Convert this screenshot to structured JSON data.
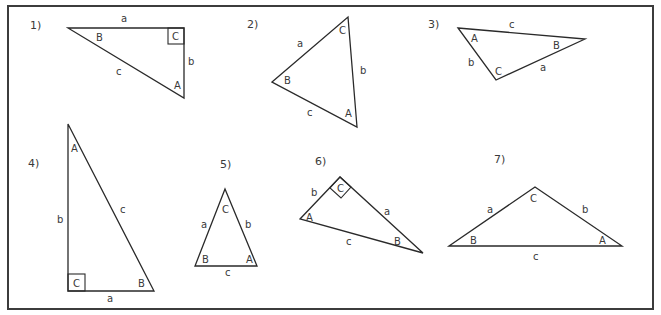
{
  "diagram": {
    "stroke_color": "#2a2a2a",
    "frame_color": "#3c3c3c",
    "text_color": "#3a3a3a",
    "triangles": [
      {
        "number_label": "1)",
        "right_angle_at": "C",
        "vertices": {
          "A": "A",
          "B": "B",
          "C": "C"
        },
        "sides": {
          "a": "a",
          "b": "b",
          "c": "c"
        }
      },
      {
        "number_label": "2)",
        "right_angle_at": null,
        "vertices": {
          "A": "A",
          "B": "B",
          "C": "C"
        },
        "sides": {
          "a": "a",
          "b": "b",
          "c": "c"
        }
      },
      {
        "number_label": "3)",
        "right_angle_at": null,
        "vertices": {
          "A": "A",
          "B": "B",
          "C": "C"
        },
        "sides": {
          "a": "a",
          "b": "b",
          "c": "c"
        }
      },
      {
        "number_label": "4)",
        "right_angle_at": "C",
        "vertices": {
          "A": "A",
          "B": "B",
          "C": "C"
        },
        "sides": {
          "a": "a",
          "b": "b",
          "c": "c"
        }
      },
      {
        "number_label": "5)",
        "right_angle_at": null,
        "vertices": {
          "A": "A",
          "B": "B",
          "C": "C"
        },
        "sides": {
          "a": "a",
          "b": "b",
          "c": "c"
        }
      },
      {
        "number_label": "6)",
        "right_angle_at": "C",
        "vertices": {
          "A": "A",
          "B": "B",
          "C": "C"
        },
        "sides": {
          "a": "a",
          "b": "b",
          "c": "c"
        }
      },
      {
        "number_label": "7)",
        "right_angle_at": null,
        "vertices": {
          "A": "A",
          "B": "B",
          "C": "C"
        },
        "sides": {
          "a": "a",
          "b": "b",
          "c": "c"
        }
      }
    ]
  }
}
